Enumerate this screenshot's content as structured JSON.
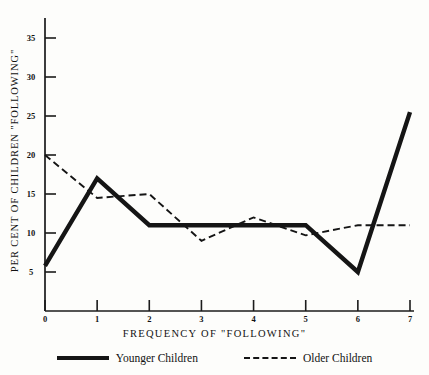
{
  "chart_data": {
    "type": "line",
    "title": "",
    "xlabel": "FREQUENCY OF \"FOLLOWING\"",
    "ylabel": "PER CENT OF CHILDREN \"FOLLOWING\"",
    "x": [
      0,
      1,
      2,
      3,
      4,
      5,
      6,
      7
    ],
    "xticklabels": [
      "0",
      "1",
      "2",
      "3",
      "4",
      "5",
      "6",
      "7"
    ],
    "yticklabels": [
      "5",
      "10",
      "15",
      "20",
      "25",
      "30",
      "35"
    ],
    "yticks": [
      5,
      10,
      15,
      20,
      25,
      30,
      35
    ],
    "xlim": [
      0,
      7
    ],
    "ylim": [
      0,
      37
    ],
    "grid": false,
    "legend_position": "below",
    "series": [
      {
        "name": "Younger Children",
        "style": "solid",
        "color": "#151515",
        "values": [
          5.8,
          17.0,
          11.0,
          11.0,
          11.0,
          11.0,
          5.0,
          25.5
        ]
      },
      {
        "name": "Older Children",
        "style": "dashed",
        "color": "#151515",
        "values": [
          20.0,
          14.5,
          15.0,
          9.0,
          12.0,
          9.7,
          11.0,
          11.0
        ]
      }
    ]
  },
  "legend": {
    "younger_label": "Younger Children",
    "older_label": "Older Children"
  }
}
